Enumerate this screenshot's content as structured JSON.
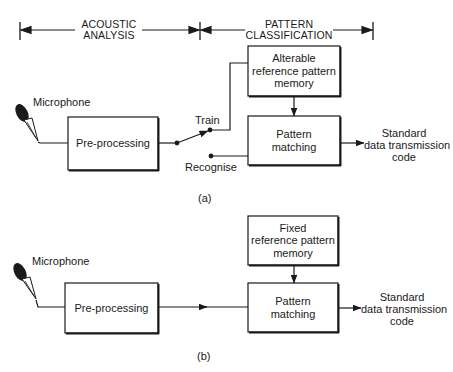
{
  "header": {
    "left_section": "ACOUSTIC\nANALYSIS",
    "left_line1": "ACOUSTIC",
    "left_line2": "ANALYSIS",
    "right_line1": "PATTERN",
    "right_line2": "CLASSIFICATION"
  },
  "diagram_a": {
    "caption": "(a)",
    "microphone_label": "Microphone",
    "preprocessing_label": "Pre-processing",
    "switch_train_label": "Train",
    "switch_recognise_label": "Recognise",
    "memory_line1": "Alterable",
    "memory_line2": "reference pattern",
    "memory_line3": "memory",
    "matching_line1": "Pattern",
    "matching_line2": "matching",
    "output_line1": "Standard",
    "output_line2": "data transmission",
    "output_line3": "code"
  },
  "diagram_b": {
    "caption": "(b)",
    "microphone_label": "Microphone",
    "preprocessing_label": "Pre-processing",
    "memory_line1": "Fixed",
    "memory_line2": "reference pattern",
    "memory_line3": "memory",
    "matching_line1": "Pattern",
    "matching_line2": "matching",
    "output_line1": "Standard",
    "output_line2": "data transmission",
    "output_line3": "code"
  },
  "colors": {
    "ink": "#1a1a1a",
    "background": "#ffffff"
  }
}
